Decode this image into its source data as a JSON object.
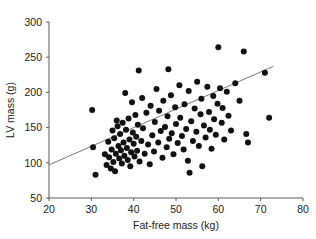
{
  "chart_data": {
    "type": "scatter",
    "title": "",
    "xlabel": "Fat-free mass (kg)",
    "ylabel": "LV mass (g)",
    "xlim": [
      20,
      80
    ],
    "ylim": [
      50,
      300
    ],
    "xticks": [
      20,
      30,
      40,
      50,
      60,
      70,
      80
    ],
    "yticks": [
      50,
      100,
      150,
      200,
      250,
      300
    ],
    "xtick_labels": [
      "20",
      "30",
      "40",
      "50",
      "60",
      "70",
      "80"
    ],
    "ytick_labels": [
      "50",
      "100",
      "150",
      "200",
      "250",
      "300"
    ],
    "grid": false,
    "legend": null,
    "marker": {
      "shape": "circle",
      "color": "#111111",
      "size": 3.0
    },
    "fit_line": {
      "type": "linear-regression",
      "color": "#6b6b6b",
      "x_start": 20.0,
      "y_start": 97.0,
      "x_end": 73.0,
      "y_end": 237.0,
      "slope": 2.64,
      "intercept": 44.2
    },
    "n_points": 110,
    "points": [
      [
        30.2,
        175.0
      ],
      [
        30.4,
        122.0
      ],
      [
        31.0,
        83.0
      ],
      [
        33.2,
        112.0
      ],
      [
        33.6,
        97.0
      ],
      [
        34.0,
        130.0
      ],
      [
        34.2,
        108.0
      ],
      [
        34.6,
        92.0
      ],
      [
        34.8,
        119.0
      ],
      [
        35.0,
        146.0
      ],
      [
        35.2,
        101.0
      ],
      [
        35.4,
        135.0
      ],
      [
        35.6,
        88.0
      ],
      [
        35.8,
        113.0
      ],
      [
        36.0,
        160.0
      ],
      [
        36.2,
        152.0
      ],
      [
        36.4,
        124.0
      ],
      [
        36.6,
        106.0
      ],
      [
        36.8,
        141.0
      ],
      [
        37.0,
        118.0
      ],
      [
        37.2,
        99.0
      ],
      [
        37.4,
        157.0
      ],
      [
        37.6,
        129.0
      ],
      [
        37.8,
        110.0
      ],
      [
        38.0,
        199.0
      ],
      [
        38.2,
        147.0
      ],
      [
        38.4,
        121.0
      ],
      [
        38.6,
        104.0
      ],
      [
        38.8,
        163.0
      ],
      [
        39.0,
        133.0
      ],
      [
        39.2,
        95.0
      ],
      [
        39.4,
        115.0
      ],
      [
        39.6,
        186.0
      ],
      [
        39.8,
        143.0
      ],
      [
        40.0,
        127.0
      ],
      [
        40.2,
        109.0
      ],
      [
        40.4,
        168.0
      ],
      [
        40.6,
        137.0
      ],
      [
        40.8,
        117.0
      ],
      [
        41.0,
        154.0
      ],
      [
        41.4,
        102.0
      ],
      [
        41.8,
        131.0
      ],
      [
        42.0,
        192.0
      ],
      [
        42.2,
        149.0
      ],
      [
        42.6,
        113.0
      ],
      [
        43.0,
        171.0
      ],
      [
        43.4,
        126.0
      ],
      [
        43.8,
        98.0
      ],
      [
        44.0,
        181.0
      ],
      [
        44.4,
        139.0
      ],
      [
        44.8,
        116.0
      ],
      [
        45.0,
        158.0
      ],
      [
        45.4,
        205.0
      ],
      [
        45.8,
        129.0
      ],
      [
        46.0,
        174.0
      ],
      [
        46.4,
        145.0
      ],
      [
        46.8,
        107.0
      ],
      [
        47.0,
        188.0
      ],
      [
        47.4,
        151.0
      ],
      [
        47.8,
        122.0
      ],
      [
        48.0,
        166.0
      ],
      [
        48.4,
        134.0
      ],
      [
        48.8,
        196.0
      ],
      [
        49.0,
        142.0
      ],
      [
        49.4,
        112.0
      ],
      [
        49.8,
        179.0
      ],
      [
        50.0,
        155.0
      ],
      [
        50.4,
        128.0
      ],
      [
        50.8,
        210.0
      ],
      [
        51.0,
        164.0
      ],
      [
        51.4,
        138.0
      ],
      [
        51.8,
        119.0
      ],
      [
        52.0,
        183.0
      ],
      [
        52.4,
        148.0
      ],
      [
        52.8,
        103.0
      ],
      [
        53.0,
        202.0
      ],
      [
        53.2,
        86.0
      ],
      [
        53.6,
        159.0
      ],
      [
        54.0,
        131.0
      ],
      [
        54.4,
        177.0
      ],
      [
        54.8,
        144.0
      ],
      [
        55.0,
        215.0
      ],
      [
        55.4,
        124.0
      ],
      [
        55.8,
        169.0
      ],
      [
        56.0,
        191.0
      ],
      [
        56.2,
        95.0
      ],
      [
        56.6,
        153.0
      ],
      [
        57.0,
        136.0
      ],
      [
        57.4,
        208.0
      ],
      [
        57.8,
        172.0
      ],
      [
        58.0,
        147.0
      ],
      [
        58.4,
        120.0
      ],
      [
        58.8,
        195.0
      ],
      [
        59.0,
        162.0
      ],
      [
        59.4,
        140.0
      ],
      [
        59.8,
        184.0
      ],
      [
        60.0,
        264.0
      ],
      [
        60.4,
        206.0
      ],
      [
        60.8,
        157.0
      ],
      [
        61.0,
        178.0
      ],
      [
        61.4,
        133.0
      ],
      [
        62.0,
        201.0
      ],
      [
        62.4,
        167.0
      ],
      [
        63.0,
        146.0
      ],
      [
        64.0,
        213.0
      ],
      [
        65.0,
        188.0
      ],
      [
        66.0,
        258.0
      ],
      [
        66.6,
        141.0
      ],
      [
        67.0,
        129.0
      ],
      [
        71.0,
        228.0
      ],
      [
        72.0,
        164.0
      ],
      [
        48.2,
        233.0
      ],
      [
        41.2,
        231.0
      ]
    ]
  }
}
